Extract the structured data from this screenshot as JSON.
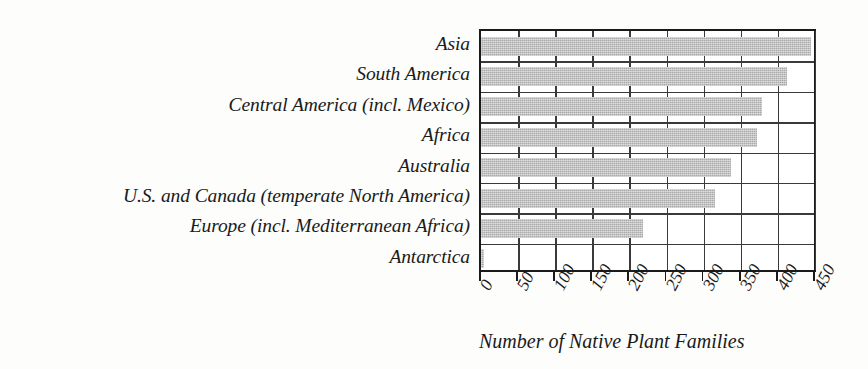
{
  "chart_data": {
    "type": "bar",
    "orientation": "horizontal",
    "title": "",
    "xlabel": "Number of Native Plant Families",
    "ylabel": "",
    "categories": [
      "Asia",
      "South America",
      "Central America (incl. Mexico)",
      "Africa",
      "Australia",
      "U.S. and Canada (temperate North America)",
      "Europe (incl. Mediterranean Africa)",
      "Antarctica"
    ],
    "values": [
      445,
      412,
      378,
      372,
      337,
      315,
      218,
      3
    ],
    "xlim": [
      0,
      450
    ],
    "ylim": [
      0,
      8
    ],
    "xticks": [
      0,
      50,
      100,
      150,
      200,
      250,
      300,
      350,
      400,
      450
    ],
    "xtick_labels": [
      "0",
      "50",
      "100",
      "150",
      "200",
      "250",
      "300",
      "350",
      "400",
      "450"
    ],
    "grid": "vertical-and-horizontal",
    "legend": "none",
    "bar_color": "#a9a9a9",
    "frame_color": "#1a1a1a",
    "grid_color": "#3a3a3a",
    "background_color": "#ffffff"
  }
}
